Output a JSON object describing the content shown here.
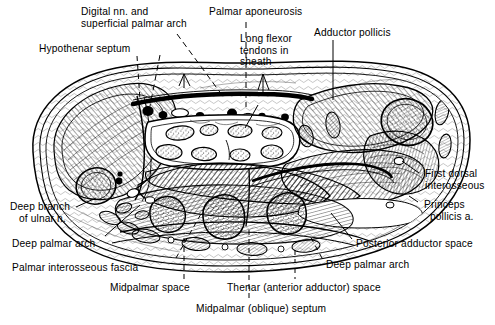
{
  "figure": {
    "type": "anatomical-cross-section",
    "background_color": "#ffffff",
    "line_color": "#000000"
  },
  "labels": [
    {
      "id": "digital-nn-superficial-palmar-arch",
      "text": "Digital nn. and\nsuperficial palmar arch",
      "x": 81,
      "y": 6,
      "align": "left",
      "leader": "dashed"
    },
    {
      "id": "palmar-aponeurosis",
      "text": "Palmar aponeurosis",
      "x": 209,
      "y": 6,
      "align": "left",
      "leader": "dashed"
    },
    {
      "id": "adductor-pollicis",
      "text": "Adductor pollicis",
      "x": 314,
      "y": 27,
      "align": "left",
      "leader": "solid"
    },
    {
      "id": "hypothenar-septum",
      "text": "Hypothenar septum",
      "x": 39,
      "y": 43,
      "align": "left",
      "leader": "dashed"
    },
    {
      "id": "long-flexor-tendons-in-sheath",
      "text": "Long flexor\ntendons in\nsheath",
      "x": 240,
      "y": 33,
      "align": "left",
      "leader": "solid"
    },
    {
      "id": "first-dorsal-interosseous",
      "text": "First dorsal\ninterosseous",
      "x": 425,
      "y": 168,
      "align": "left",
      "leader": "solid"
    },
    {
      "id": "princeps-pollicis-a",
      "text": "Princeps\n  pollicis a.",
      "x": 424,
      "y": 199,
      "align": "left",
      "leader": "solid"
    },
    {
      "id": "posterior-adductor-space",
      "text": "Posterior adductor space",
      "x": 356,
      "y": 238,
      "align": "left",
      "leader": "solid"
    },
    {
      "id": "deep-palmar-arch-right",
      "text": "Deep palmar arch",
      "x": 326,
      "y": 259,
      "align": "left",
      "leader": "dashed"
    },
    {
      "id": "thenar-anterior-adductor-space",
      "text": "Thenar (anterior adductor) space",
      "x": 227,
      "y": 282,
      "align": "left",
      "leader": "dashed"
    },
    {
      "id": "midpalmar-oblique-septum",
      "text": "Midpalmar (oblique) septum",
      "x": 196,
      "y": 303,
      "align": "left",
      "leader": "dashed"
    },
    {
      "id": "midpalmar-space",
      "text": "Midpalmar space",
      "x": 110,
      "y": 282,
      "align": "left",
      "leader": "dashed"
    },
    {
      "id": "palmar-interosseous-fascia",
      "text": "Palmar interosseous fascia",
      "x": 12,
      "y": 262,
      "align": "left",
      "leader": "dashed"
    },
    {
      "id": "deep-palmar-arch-left",
      "text": "Deep palmar arch",
      "x": 12,
      "y": 238,
      "align": "left",
      "leader": "solid"
    },
    {
      "id": "deep-branch-of-ulnar-n",
      "text": "Deep branch\n   of ulnar n.",
      "x": 10,
      "y": 201,
      "align": "left",
      "leader": "solid"
    }
  ]
}
